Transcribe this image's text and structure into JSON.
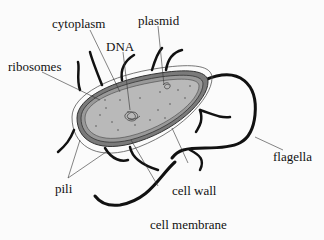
{
  "diagram": {
    "colors": {
      "background": "#fbfbfb",
      "cytoplasm": "#b9b9b9",
      "wall": "#7a7a7a",
      "capsule_outline": "#444444",
      "appendage": "#111111",
      "leader_line": "#333333"
    },
    "labels": {
      "cytoplasm": "cytoplasm",
      "plasmid": "plasmid",
      "dna": "DNA",
      "ribosomes": "ribosomes",
      "flagella": "flagella",
      "pili": "pili",
      "cell_wall": "cell wall",
      "cell_membrane": "cell membrane"
    }
  }
}
